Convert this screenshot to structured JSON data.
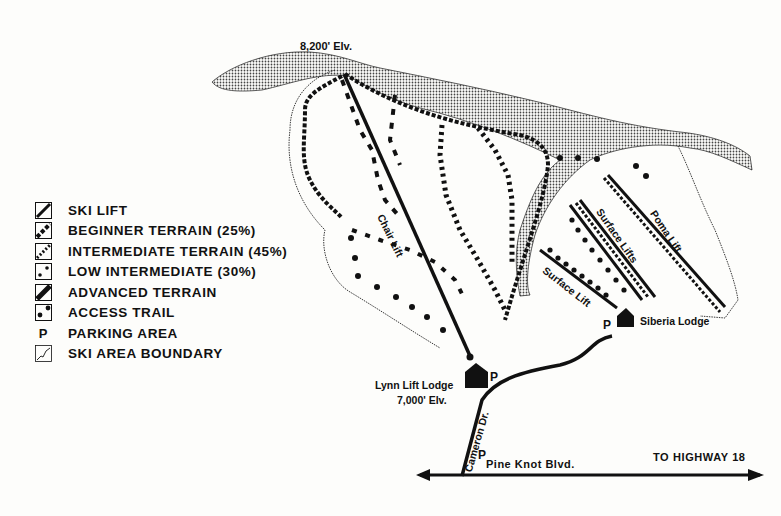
{
  "map": {
    "summit_elevation": "8,200' Elv.",
    "base_elevation": "7,000' Elv.",
    "lodges": [
      {
        "name": "Lynn Lift Lodge"
      },
      {
        "name": "Siberia Lodge"
      }
    ],
    "lifts": [
      {
        "name": "Chair Lift"
      },
      {
        "name": "Surface Lifts"
      },
      {
        "name": "Surface Lift"
      },
      {
        "name": "Poma Lift"
      }
    ],
    "roads": [
      {
        "name": "Cameron Dr."
      },
      {
        "name": "Pine Knot Blvd."
      }
    ],
    "directions": {
      "highway": "TO HIGHWAY 18"
    },
    "parking_symbol": "P"
  },
  "legend": {
    "items": [
      {
        "icon": "ski-lift-icon",
        "label": "SKI LIFT"
      },
      {
        "icon": "beginner-terrain-icon",
        "label": "BEGINNER TERRAIN (25%)"
      },
      {
        "icon": "intermediate-terrain-icon",
        "label": "INTERMEDIATE TERRAIN (45%)"
      },
      {
        "icon": "low-intermediate-icon",
        "label": "LOW INTERMEDIATE (30%)"
      },
      {
        "icon": "advanced-terrain-icon",
        "label": "ADVANCED TERRAIN"
      },
      {
        "icon": "access-trail-icon",
        "label": "ACCESS TRAIL"
      },
      {
        "icon": "parking-icon",
        "label": "PARKING AREA",
        "symbol": "P"
      },
      {
        "icon": "boundary-icon",
        "label": "SKI AREA BOUNDARY"
      }
    ]
  },
  "colors": {
    "ink": "#111111",
    "paper": "#fdfdfb",
    "stipple": "#8a8a8a"
  }
}
